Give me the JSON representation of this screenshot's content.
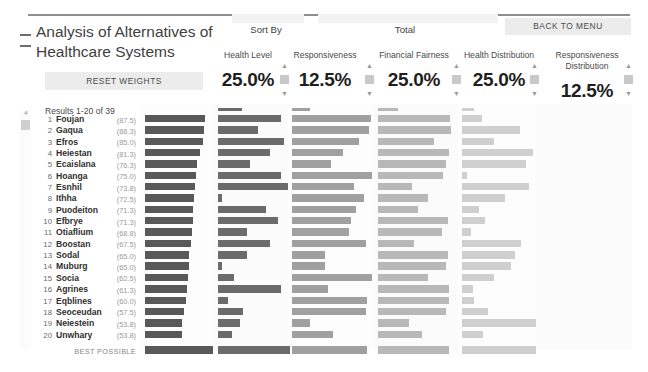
{
  "app": {
    "title": "Analysis of Alternatives of Healthcare Systems",
    "collapse_icon": "collapse-dashes-icon"
  },
  "toolbar": {
    "reset_weights_label": "RESET WEIGHTS",
    "back_to_menu_label": "BACK TO MENU",
    "sort_by_label": "Sort By",
    "total_label": "Total"
  },
  "list_header": {
    "results_label": "Results 1-20 of 39",
    "total_column_label": "Total ▼",
    "sort_caret_icon": "caret-down-icon"
  },
  "scrollbar": {
    "up_arrow_icon": "chevron-up-icon",
    "down_arrow_icon": "chevron-down-icon",
    "up_glyph": "ⱏ",
    "down_glyph": "ⱟ"
  },
  "weight_columns": [
    {
      "name": "Health Level",
      "value": "25.0%",
      "color": "#595959"
    },
    {
      "name": "Responsiveness",
      "value": "12.5%",
      "color": "#828282"
    },
    {
      "name": "Financial Fairness",
      "value": "25.0%",
      "color": "#9c9c9c"
    },
    {
      "name": "Health Distribution",
      "value": "25.0%",
      "color": "#b4b4b4"
    },
    {
      "name": "Responsiveness Distribution",
      "value": "12.5%",
      "color": "#c6c6c6"
    }
  ],
  "best_possible": {
    "label": "BEST POSSIBLE"
  },
  "chart_data": {
    "type": "bar",
    "title": "Analysis of Alternatives of Healthcare Systems",
    "xlabel": "",
    "ylabel": "",
    "grid": false,
    "legend_position": "top",
    "categories": [
      "Foujan",
      "Gaqua",
      "Efros",
      "Heiestan",
      "Ecaislana",
      "Hoanga",
      "Esnhil",
      "Ithha",
      "Puodeiton",
      "Efbrye",
      "Otiaflium",
      "Boostan",
      "Sodal",
      "Muburg",
      "Socia",
      "Agrines",
      "Eqblines",
      "Seoceudan",
      "Neiestein",
      "Unwhary"
    ],
    "ranks": [
      1,
      2,
      3,
      4,
      5,
      6,
      7,
      8,
      9,
      10,
      11,
      12,
      13,
      14,
      15,
      16,
      17,
      18,
      19,
      20
    ],
    "totals": [
      87.5,
      86.3,
      85.0,
      81.3,
      76.3,
      75.0,
      73.8,
      72.5,
      71.3,
      71.3,
      68.8,
      67.5,
      65.0,
      65.0,
      62.5,
      61.3,
      60.0,
      57.5,
      53.8,
      53.8
    ],
    "series": [
      {
        "name": "Total",
        "color": "#595959",
        "values": [
          87.5,
          86.3,
          85.0,
          81.3,
          76.3,
          75.0,
          73.8,
          72.5,
          71.3,
          71.3,
          68.8,
          67.5,
          65.0,
          65.0,
          62.5,
          61.3,
          60.0,
          57.5,
          53.8,
          53.8
        ],
        "best": 100
      },
      {
        "name": "Health Level",
        "color": "#6b6b6b",
        "values": [
          88,
          55,
          92,
          72,
          45,
          88,
          97,
          5,
          66,
          83,
          40,
          72,
          40,
          6,
          22,
          88,
          14,
          35,
          30,
          20
        ],
        "best": 100
      },
      {
        "name": "Responsiveness",
        "color": "#a0a0a0",
        "values": [
          96,
          94,
          82,
          62,
          48,
          98,
          76,
          88,
          78,
          72,
          70,
          90,
          40,
          40,
          98,
          44,
          92,
          90,
          22,
          50
        ],
        "best": 92
      },
      {
        "name": "Health Distribution",
        "color": "#b8b8b8",
        "values": [
          97,
          98,
          76,
          96,
          92,
          88,
          46,
          68,
          54,
          94,
          86,
          48,
          94,
          92,
          68,
          96,
          96,
          92,
          42,
          60
        ],
        "best": 96
      },
      {
        "name": "Responsiveness Distribution",
        "color": "#cfcfcf",
        "values": [
          26,
          76,
          42,
          94,
          84,
          6,
          88,
          56,
          22,
          30,
          12,
          78,
          70,
          64,
          42,
          14,
          16,
          34,
          98,
          28
        ],
        "best": 98
      }
    ]
  }
}
